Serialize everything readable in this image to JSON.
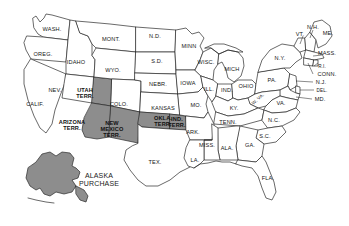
{
  "map": {
    "title": "United States with Western Territories and Alaska Purchase",
    "background_color": "#ffffff",
    "outline_color": "#2a2a2a",
    "territory_fill_color": "#8d8d8d",
    "state_fill_color": "#ffffff",
    "labels": [
      {
        "id": "wash",
        "text": "WASH.",
        "x": 52,
        "y": 29
      },
      {
        "id": "oreg",
        "text": "OREG.",
        "x": 43,
        "y": 54
      },
      {
        "id": "idaho",
        "text": "IDAHO",
        "x": 76,
        "y": 62
      },
      {
        "id": "mont",
        "text": "MONT.",
        "x": 111,
        "y": 39
      },
      {
        "id": "nd",
        "text": "N.D.",
        "x": 155,
        "y": 36
      },
      {
        "id": "sd",
        "text": "S.D.",
        "x": 157,
        "y": 61
      },
      {
        "id": "minn",
        "text": "MINN",
        "x": 189,
        "y": 46
      },
      {
        "id": "wyo",
        "text": "WYO.",
        "x": 113,
        "y": 70
      },
      {
        "id": "nebr",
        "text": "NEBR.",
        "x": 158,
        "y": 84
      },
      {
        "id": "iowa",
        "text": "IOWA",
        "x": 188,
        "y": 83
      },
      {
        "id": "wisc",
        "text": "WISC.",
        "x": 206,
        "y": 62
      },
      {
        "id": "mich",
        "text": "MICH",
        "x": 232,
        "y": 69
      },
      {
        "id": "nev",
        "text": "NEV.",
        "x": 55,
        "y": 90
      },
      {
        "id": "utah-terr",
        "text": "UTAH\nTERR.",
        "x": 85,
        "y": 93,
        "territory": true
      },
      {
        "id": "colo",
        "text": "COLO.",
        "x": 119,
        "y": 104
      },
      {
        "id": "kansas",
        "text": "KANSAS",
        "x": 163,
        "y": 108
      },
      {
        "id": "mo",
        "text": "MO.",
        "x": 196,
        "y": 105
      },
      {
        "id": "ill",
        "text": "ILL.",
        "x": 209,
        "y": 89
      },
      {
        "id": "ind",
        "text": "IND.",
        "x": 227,
        "y": 90
      },
      {
        "id": "ohio",
        "text": "OHIO",
        "x": 246,
        "y": 86
      },
      {
        "id": "pa",
        "text": "PA.",
        "x": 272,
        "y": 80
      },
      {
        "id": "ny",
        "text": "N.Y.",
        "x": 280,
        "y": 58
      },
      {
        "id": "vt",
        "text": "VT.",
        "x": 300,
        "y": 34
      },
      {
        "id": "nh",
        "text": "N.H.",
        "x": 313,
        "y": 27
      },
      {
        "id": "me",
        "text": "ME.",
        "x": 328,
        "y": 33
      },
      {
        "id": "mass",
        "text": "MASS.",
        "x": 327,
        "y": 53
      },
      {
        "id": "ri",
        "text": "R.I.",
        "x": 322,
        "y": 66
      },
      {
        "id": "conn",
        "text": "CONN.",
        "x": 327,
        "y": 74
      },
      {
        "id": "nj",
        "text": "N.J.",
        "x": 321,
        "y": 82
      },
      {
        "id": "del",
        "text": "DEL.",
        "x": 322,
        "y": 90
      },
      {
        "id": "md",
        "text": "MD.",
        "x": 320,
        "y": 99
      },
      {
        "id": "wva",
        "text": "W. VA.",
        "x": 258,
        "y": 99,
        "rotate": -42
      },
      {
        "id": "va",
        "text": "VA.",
        "x": 281,
        "y": 103
      },
      {
        "id": "calif",
        "text": "CALIF.",
        "x": 35,
        "y": 104
      },
      {
        "id": "arizona-terr",
        "text": "ARIZONA\nTERR.",
        "x": 72,
        "y": 125,
        "territory": true
      },
      {
        "id": "newmexico-terr",
        "text": "NEW\nMEXICO\nTERR.",
        "x": 112,
        "y": 129,
        "territory": true
      },
      {
        "id": "okla-terr",
        "text": "OKLA.\nTERR.",
        "x": 163,
        "y": 121,
        "territory": true
      },
      {
        "id": "ind-terr",
        "text": "IND.\nTERR.",
        "x": 177,
        "y": 122,
        "territory": true
      },
      {
        "id": "ark",
        "text": "ARK.",
        "x": 193,
        "y": 132
      },
      {
        "id": "tenn",
        "text": "TENN.",
        "x": 228,
        "y": 122
      },
      {
        "id": "ky",
        "text": "KY.",
        "x": 234,
        "y": 108
      },
      {
        "id": "nc",
        "text": "N.C.",
        "x": 274,
        "y": 120
      },
      {
        "id": "sc",
        "text": "S.C.",
        "x": 265,
        "y": 136
      },
      {
        "id": "miss",
        "text": "MISS.",
        "x": 207,
        "y": 145
      },
      {
        "id": "ala",
        "text": "ALA.",
        "x": 227,
        "y": 148
      },
      {
        "id": "ga",
        "text": "GA.",
        "x": 250,
        "y": 145
      },
      {
        "id": "la",
        "text": "LA.",
        "x": 195,
        "y": 160
      },
      {
        "id": "tex",
        "text": "TEX.",
        "x": 155,
        "y": 162
      },
      {
        "id": "fla",
        "text": "FLA.",
        "x": 268,
        "y": 178
      },
      {
        "id": "alaska-purchase",
        "text": "ALASKA\nPURCHASE",
        "x": 99,
        "y": 180
      }
    ],
    "territories": [
      {
        "id": "utah-terr",
        "name": "Utah Territory",
        "shaded": true
      },
      {
        "id": "arizona-terr",
        "name": "Arizona Territory",
        "shaded": true
      },
      {
        "id": "newmexico-terr",
        "name": "New Mexico Territory",
        "shaded": true
      },
      {
        "id": "okla-terr",
        "name": "Oklahoma Territory",
        "shaded": true
      },
      {
        "id": "ind-terr",
        "name": "Indian Territory",
        "shaded": true
      },
      {
        "id": "alaska-purchase",
        "name": "Alaska Purchase",
        "shaded": true
      }
    ]
  }
}
